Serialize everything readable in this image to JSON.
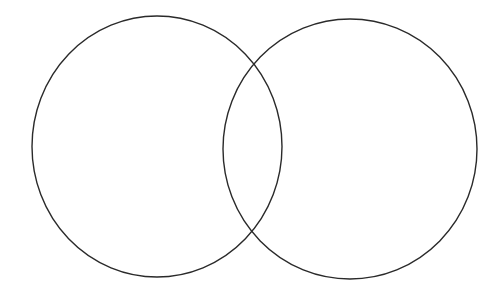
{
  "diagram": {
    "type": "venn",
    "background": "#ffffff",
    "stroke_color": "#2a2a2a",
    "stroke_width": 1.4,
    "sets": [
      {
        "id": "left",
        "label": "",
        "cx": 157,
        "cy": 146.5,
        "rx": 125,
        "ry": 130.5
      },
      {
        "id": "right",
        "label": "",
        "cx": 350,
        "cy": 149,
        "rx": 127,
        "ry": 130
      }
    ],
    "overlap_label": ""
  }
}
